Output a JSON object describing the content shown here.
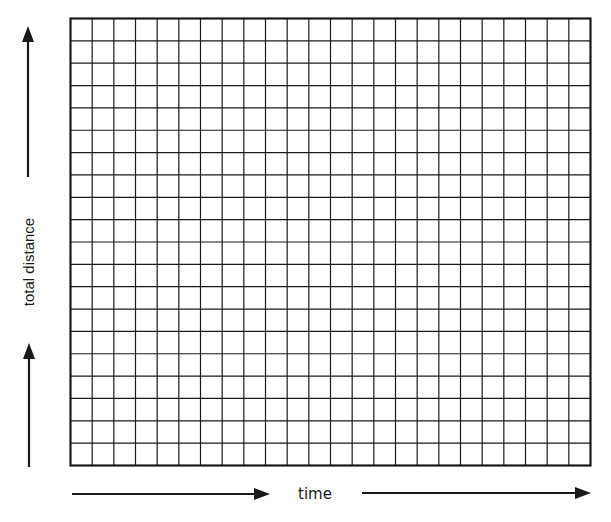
{
  "diagram": {
    "type": "blank distance-time graph grid",
    "x_axis_label": "time",
    "y_axis_label": "total distance",
    "grid": {
      "columns": 24,
      "rows": 20
    },
    "colors": {
      "line": "#1a1a1a",
      "background": "#ffffff"
    }
  }
}
